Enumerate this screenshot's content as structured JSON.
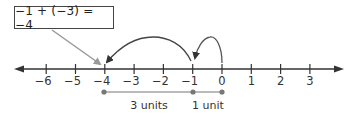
{
  "equation": "−1 + (−3) = −4",
  "number_line": {
    "ticks": [
      -6,
      -5,
      -4,
      -3,
      -2,
      -1,
      0,
      1,
      2,
      3
    ],
    "tick_labels": [
      "−6",
      "−5",
      "−4",
      "−3",
      "−2",
      "−1",
      "0",
      "1",
      "2",
      "3"
    ],
    "range": [
      -7,
      4
    ],
    "arrows_both_ends": true
  },
  "jumps": [
    {
      "from": 0,
      "to": -1,
      "label": "1 unit"
    },
    {
      "from": -1,
      "to": -4,
      "label": "3 units"
    }
  ],
  "segments": {
    "a_label": "3 units",
    "b_label": "1 unit",
    "points": [
      -4,
      -1,
      0
    ]
  },
  "colors": {
    "line": "#333333",
    "pointer": "#999999",
    "segment": "#777777"
  }
}
